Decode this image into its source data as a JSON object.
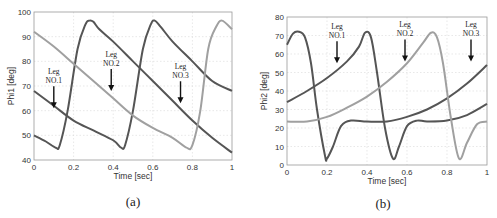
{
  "chart_data": [
    {
      "id": "a",
      "type": "line",
      "caption": "(a)",
      "title": "",
      "xlabel": "Time [sec]",
      "ylabel": "Phi1 [deg]",
      "xlim": [
        0,
        1
      ],
      "ylim": [
        40,
        100
      ],
      "xticks": [
        "0",
        "0.2",
        "0.4",
        "0.6",
        "0.8",
        "1"
      ],
      "yticks": [
        "40",
        "50",
        "60",
        "70",
        "80",
        "90",
        "100"
      ],
      "grid": true,
      "series": [
        {
          "name": "Leg NO.1",
          "color": "#555555",
          "x": [
            0,
            0.06,
            0.11,
            0.13,
            0.17,
            0.22,
            0.26,
            0.28,
            0.3,
            0.33,
            0.4,
            0.5,
            0.6,
            0.7,
            0.8,
            0.9,
            1.0
          ],
          "y": [
            50,
            47.5,
            45,
            46,
            60,
            85,
            95,
            96.5,
            96,
            93,
            88,
            80,
            72,
            64,
            56,
            49,
            43
          ]
        },
        {
          "name": "Leg NO.2",
          "color": "#555555",
          "x": [
            0,
            0.1,
            0.2,
            0.3,
            0.4,
            0.44,
            0.46,
            0.5,
            0.55,
            0.59,
            0.61,
            0.64,
            0.7,
            0.8,
            0.9,
            1.0
          ],
          "y": [
            68,
            62,
            56,
            52,
            48,
            45,
            46,
            60,
            85,
            95,
            96.5,
            94,
            88,
            80,
            72,
            68
          ]
        },
        {
          "name": "Leg NO.3",
          "color": "#a0a0a0",
          "x": [
            0,
            0.1,
            0.2,
            0.3,
            0.4,
            0.5,
            0.6,
            0.7,
            0.77,
            0.8,
            0.84,
            0.88,
            0.92,
            0.95,
            1.0
          ],
          "y": [
            92,
            86,
            79,
            72,
            65,
            58,
            53,
            49,
            45,
            46,
            60,
            85,
            94,
            96.5,
            93
          ]
        }
      ],
      "annotations": [
        {
          "text": [
            "Leg",
            "NO.1"
          ],
          "x": 0.1,
          "arrow_to_y": 61
        },
        {
          "text": [
            "Leg",
            "NO.2"
          ],
          "x": 0.39,
          "arrow_to_y": 68
        },
        {
          "text": [
            "Leg",
            "NO.3"
          ],
          "x": 0.74,
          "arrow_to_y": 63
        }
      ]
    },
    {
      "id": "b",
      "type": "line",
      "caption": "(b)",
      "title": "",
      "xlabel": "Time [sec]",
      "ylabel": "Phi2 [deg]",
      "xlim": [
        0,
        1
      ],
      "ylim": [
        0,
        80
      ],
      "xticks": [
        "0",
        "0.2",
        "0.4",
        "0.6",
        "0.8",
        "1"
      ],
      "yticks": [
        "0",
        "10",
        "20",
        "30",
        "40",
        "50",
        "60",
        "70",
        "80"
      ],
      "grid": true,
      "series": [
        {
          "name": "Leg NO.1",
          "color": "#555555",
          "x": [
            0,
            0.03,
            0.06,
            0.09,
            0.12,
            0.15,
            0.19,
            0.2,
            0.23,
            0.27,
            0.32,
            0.4,
            0.5,
            0.6,
            0.7,
            0.8,
            0.9,
            1.0
          ],
          "y": [
            65,
            71,
            72,
            69,
            55,
            30,
            5,
            3.5,
            10,
            21,
            24,
            23.5,
            23.5,
            26,
            30,
            36,
            44,
            54
          ]
        },
        {
          "name": "Leg NO.2",
          "color": "#555555",
          "x": [
            0,
            0.1,
            0.2,
            0.3,
            0.36,
            0.39,
            0.42,
            0.45,
            0.49,
            0.53,
            0.56,
            0.6,
            0.65,
            0.7,
            0.8,
            0.9,
            1.0
          ],
          "y": [
            34,
            40,
            47,
            56,
            64,
            71.5,
            69,
            50,
            20,
            3.5,
            10,
            21,
            24,
            23.5,
            24,
            27,
            33
          ]
        },
        {
          "name": "Leg NO.3",
          "color": "#a0a0a0",
          "x": [
            0,
            0.1,
            0.2,
            0.3,
            0.4,
            0.5,
            0.6,
            0.68,
            0.72,
            0.75,
            0.78,
            0.82,
            0.86,
            0.9,
            0.95,
            1.0
          ],
          "y": [
            23.5,
            23.5,
            26,
            31,
            37,
            45,
            55,
            66,
            71.5,
            69,
            55,
            25,
            3.5,
            12,
            22,
            23.5
          ]
        }
      ],
      "annotations": [
        {
          "text": [
            "Leg",
            "NO.1"
          ],
          "x": 0.25,
          "arrow_to_y": 55
        },
        {
          "text": [
            "Leg",
            "NO.2"
          ],
          "x": 0.59,
          "arrow_to_y": 56
        },
        {
          "text": [
            "Leg",
            "NO.3"
          ],
          "x": 0.92,
          "arrow_to_y": 56
        }
      ]
    }
  ]
}
